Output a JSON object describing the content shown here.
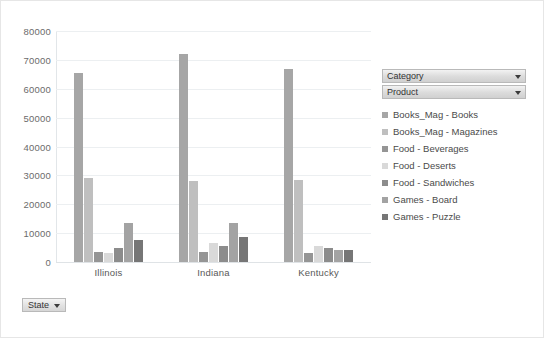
{
  "filters": {
    "category": {
      "label": "Category",
      "caret": "chevron-down-icon"
    },
    "product": {
      "label": "Product",
      "caret": "chevron-down-icon"
    },
    "state": {
      "label": "State",
      "caret": "chevron-down-icon"
    }
  },
  "colors": {
    "series": [
      "#a6a6a6",
      "#bfbfbf",
      "#959595",
      "#d9d9d9",
      "#8c8c8c",
      "#a3a3a3",
      "#767676"
    ],
    "gridline": "#eceff1",
    "axis": "#e2e6e9",
    "text": "#595959",
    "border": "#e6e6e6"
  },
  "chart_data": {
    "type": "bar",
    "title": "",
    "xlabel": "",
    "ylabel": "",
    "categories": [
      "Illinois",
      "Indiana",
      "Kentucky"
    ],
    "yticks": [
      80000,
      70000,
      60000,
      50000,
      40000,
      30000,
      20000,
      10000,
      0
    ],
    "ytick_labels": [
      "80000",
      "70000",
      "60000",
      "50000",
      "40000",
      "30000",
      "20000",
      "10000",
      "0"
    ],
    "ylim": [
      0,
      80000
    ],
    "grid": true,
    "legend_position": "right",
    "series": [
      {
        "name": "Books_Mag - Books",
        "values": [
          65500,
          72000,
          67000
        ]
      },
      {
        "name": "Books_Mag - Magazines",
        "values": [
          29000,
          28000,
          28500
        ]
      },
      {
        "name": "Food - Beverages",
        "values": [
          3500,
          3500,
          3000
        ]
      },
      {
        "name": "Food - Deserts",
        "values": [
          3000,
          6500,
          5500
        ]
      },
      {
        "name": "Food - Sandwiches",
        "values": [
          5000,
          5500,
          5000
        ]
      },
      {
        "name": "Games - Board",
        "values": [
          13500,
          13500,
          4000
        ]
      },
      {
        "name": "Games - Puzzle",
        "values": [
          7500,
          8500,
          4000
        ]
      }
    ]
  }
}
